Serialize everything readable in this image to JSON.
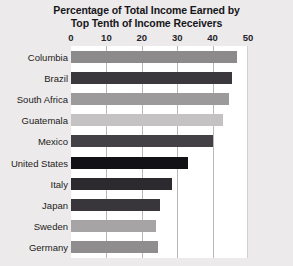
{
  "chart_data": {
    "type": "bar",
    "orientation": "horizontal",
    "title": "Percentage of Total Income Earned by Top Tenth of Income Receivers",
    "title_lines": [
      "Percentage of Total Income Earned by",
      "Top Tenth of Income Receivers"
    ],
    "xlabel": "",
    "ylabel": "",
    "xlim": [
      0,
      50
    ],
    "xticks": [
      0,
      10,
      20,
      30,
      40,
      50
    ],
    "xtick_labels": [
      "0",
      "10",
      "20",
      "30",
      "40",
      "50"
    ],
    "grid": true,
    "grid_axis": "x",
    "legend": false,
    "categories": [
      "Columbia",
      "Brazil",
      "South Africa",
      "Guatemala",
      "Mexico",
      "United States",
      "Italy",
      "Japan",
      "Sweden",
      "Germany"
    ],
    "values": [
      47,
      45.5,
      44.5,
      43,
      40,
      33,
      28.5,
      25,
      24,
      24.5
    ],
    "bar_colors": [
      "#8c8a8a",
      "#3a383c",
      "#9c9a9a",
      "#c4c2c2",
      "#434145",
      "#121116",
      "#2c2a2e",
      "#38363a",
      "#a6a4a4",
      "#8f8d8d"
    ],
    "plot_background": "#ffffff",
    "page_background": "#eceaea",
    "gridline_color": "#b9b7b7",
    "title_color": "#17161a"
  }
}
